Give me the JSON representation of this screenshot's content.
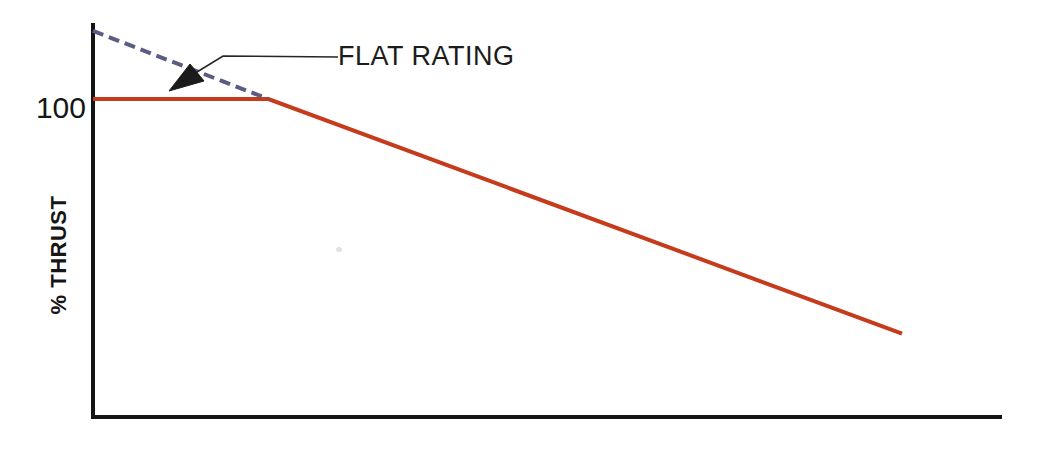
{
  "figure": {
    "background": "#ffffff",
    "ylabel": "% THRUST",
    "y_tick_100": "100",
    "annotation_flat_rating": "FLAT RATING"
  },
  "colors": {
    "axis": "#141414",
    "text": "#161616",
    "thrust_line_red": "#c53b1b",
    "flat_rating_dashed_blue": "#5a5c82",
    "leader_line": "#262626"
  },
  "chart_data": {
    "type": "line",
    "title": "",
    "xlabel": "",
    "ylabel": "% THRUST",
    "x_range": [
      0,
      1
    ],
    "y_range": [
      0,
      124
    ],
    "x_ticks": [],
    "y_ticks": [
      {
        "value": 100,
        "label": "100"
      }
    ],
    "grid": false,
    "legend": false,
    "x_axis_note": "x axis has no tick labels (schematic, typically ambient temperature)",
    "plot_area_px": {
      "left": 93,
      "right": 1002,
      "top": 23,
      "bottom": 416
    },
    "axis_stroke_px": 4,
    "series": [
      {
        "id": "thrust",
        "name": "flat-rated thrust line",
        "style": "solid",
        "dash": null,
        "color": "#c53b1b",
        "width_px": 4,
        "points": [
          [
            0,
            100
          ],
          [
            0.193,
            100
          ],
          [
            0.89,
            26
          ]
        ]
      },
      {
        "id": "flat-rating-extension",
        "name": "flat rating extension (dashed)",
        "style": "dashed",
        "dash": "11 6",
        "color": "#5a5c82",
        "width_px": 4,
        "points": [
          [
            0,
            121.5
          ],
          [
            0.193,
            100
          ]
        ]
      }
    ],
    "annotations": [
      {
        "text": "FLAT RATING",
        "arrow_points_to": "flat segment where dashed rating line meets the red thrust line"
      }
    ]
  }
}
